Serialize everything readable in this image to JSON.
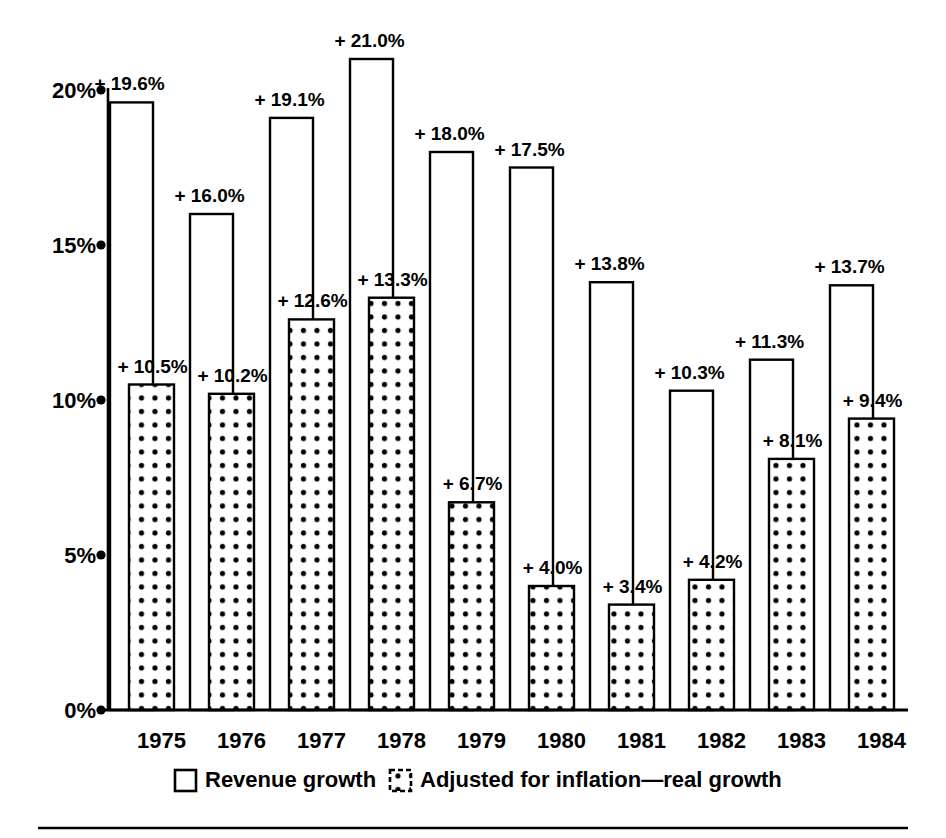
{
  "chart_data": {
    "type": "bar",
    "title": "",
    "subtitle": "",
    "xlabel": "",
    "ylabel": "",
    "ylim": [
      0,
      22.5
    ],
    "yticks": [
      0,
      5,
      10,
      15,
      20
    ],
    "ytick_labels": [
      "0%",
      "5%",
      "10%",
      "15%",
      "20%"
    ],
    "grid": false,
    "legend_position": "bottom",
    "categories": [
      "1975",
      "1976",
      "1977",
      "1978",
      "1979",
      "1980",
      "1981",
      "1982",
      "1983",
      "1984"
    ],
    "series": [
      {
        "name": "Revenue growth",
        "style": "open",
        "values": [
          19.6,
          16.0,
          19.1,
          21.0,
          18.0,
          17.5,
          13.8,
          10.3,
          11.3,
          13.7
        ],
        "labels": [
          "+ 19.6%",
          "+ 16.0%",
          "+ 19.1%",
          "+ 21.0%",
          "+ 18.0%",
          "+ 17.5%",
          "+ 13.8%",
          "+ 10.3%",
          "+ 11.3%",
          "+ 13.7%"
        ]
      },
      {
        "name": "Adjusted for inflation—real growth",
        "style": "dotted",
        "values": [
          10.5,
          10.2,
          12.6,
          13.3,
          6.7,
          4.0,
          3.4,
          4.2,
          8.1,
          9.4
        ],
        "labels": [
          "+ 10.5%",
          "+ 10.2%",
          "+ 12.6%",
          "+ 13.3%",
          "+ 6.7%",
          "+ 4.0%",
          "+ 3.4%",
          "+ 4.2%",
          "+ 8.1%",
          "+ 9.4%"
        ]
      }
    ]
  },
  "legend": {
    "items": [
      {
        "label": "Revenue growth",
        "swatch": "open-square-swatch"
      },
      {
        "label": "Adjusted for inflation—real growth",
        "swatch": "dotted-square-swatch"
      }
    ]
  },
  "colors": {
    "ink": "#000000",
    "paper": "#ffffff"
  }
}
